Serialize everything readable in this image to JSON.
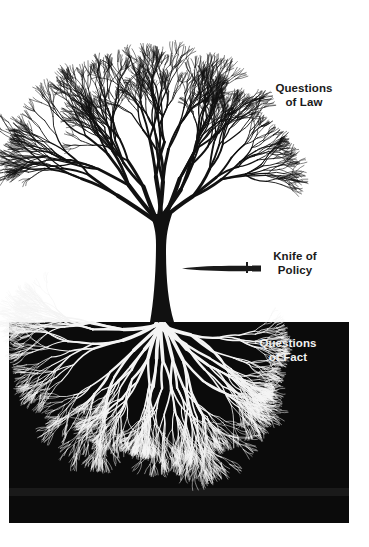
{
  "diagram": {
    "type": "metaphor-illustration",
    "colors": {
      "background": "#ffffff",
      "tree": "#111111",
      "ground": "#0b0b0b",
      "roots": "#f4f4f4"
    }
  },
  "labels": {
    "law": {
      "line1": "Questions",
      "line2": "of Law"
    },
    "policy": {
      "line1": "Knife of",
      "line2": "Policy"
    },
    "fact": {
      "line1": "Questions",
      "line2": "of Fact"
    }
  },
  "icons": {
    "knife": "knife-icon"
  }
}
